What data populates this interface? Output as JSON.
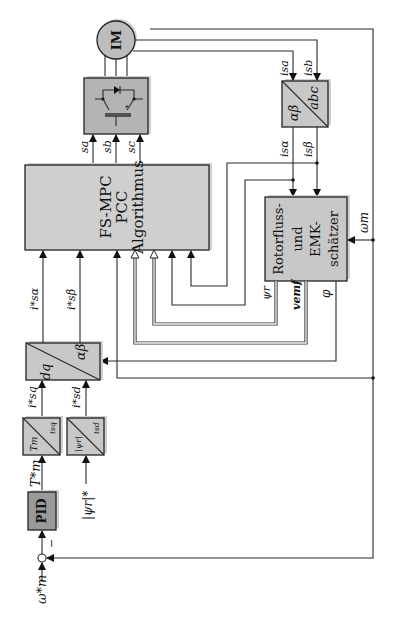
{
  "diagram": {
    "orientation": "rotated-90-ccw",
    "blocks": {
      "motor": {
        "label": "IM"
      },
      "inverter": {
        "label": ""
      },
      "fs_mpc": {
        "line1": "FS-MPC",
        "line2": "PCC",
        "line3": "Algorithmus"
      },
      "abc_to_ab": {
        "top": "abc",
        "bottom": "αβ"
      },
      "estimator": {
        "line1": "Rotorfluss-",
        "line2": "und",
        "line3": "EMK-",
        "line4": "schätzer"
      },
      "dq_to_ab": {
        "left": "dq",
        "right": "αβ"
      },
      "tm_to_isq": {
        "a": "Tm",
        "b": "isq"
      },
      "psi_to_isd": {
        "a": "|ψr|",
        "b": "isd"
      },
      "pid": {
        "label": "PID"
      }
    },
    "signals": {
      "sa": "sa",
      "sb": "sb",
      "sc": "sc",
      "isa": "isa",
      "isb": "isb",
      "is_alpha": "isα",
      "is_beta": "isβ",
      "is_alpha_ref": "i*sα",
      "is_beta_ref": "i*sβ",
      "isq_ref": "i*sq",
      "isd_ref": "i*sd",
      "tm_ref": "T*m",
      "psi_ref": "|ψr|*",
      "omega_ref": "ω*m",
      "omega_m": "ωm",
      "psi_r": "ψr",
      "v_emf": "vemf",
      "phi": "φ",
      "minus": "−"
    }
  }
}
